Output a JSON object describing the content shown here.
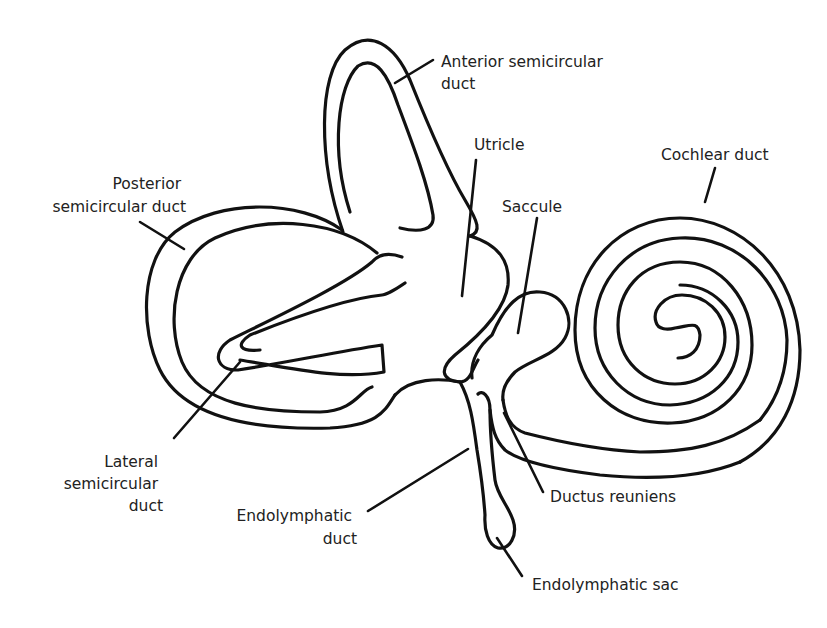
{
  "diagram": {
    "colors": {
      "line": "#111111",
      "text": "#222222",
      "background": "#ffffff"
    },
    "labels": {
      "anterior_semicircular_duct": {
        "line1": "Anterior semicircular",
        "line2": "duct"
      },
      "utricle": {
        "line1": "Utricle"
      },
      "cochlear_duct": {
        "line1": "Cochlear duct"
      },
      "posterior_semicircular_duct": {
        "line1": "Posterior",
        "line2": "semicircular duct"
      },
      "saccule": {
        "line1": "Saccule"
      },
      "lateral_semicircular_duct": {
        "line1": "Lateral",
        "line2": "semicircular",
        "line3": "duct"
      },
      "ductus_reuniens": {
        "line1": "Ductus reuniens"
      },
      "endolymphatic_duct": {
        "line1": "Endolymphatic",
        "line2": "duct"
      },
      "endolymphatic_sac": {
        "line1": "Endolymphatic sac"
      }
    }
  }
}
